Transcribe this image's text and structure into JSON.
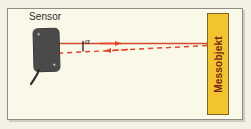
{
  "diagram": {
    "title_sensor": "Sensor",
    "title_target": "Messobjekt",
    "angle_symbol": "α",
    "icons": {
      "sensor_body": "sensor-block-icon",
      "mount_hole": "mounting-hole-icon",
      "cable": "cable-icon",
      "emitted_beam": "solid-arrow-right-icon",
      "reflected_beam": "dashed-arrow-left-icon",
      "angle_tick": "angle-tick-icon"
    },
    "colors": {
      "panel_background": "#faf8e8",
      "panel_border": "#8e8d84",
      "outer_background": "#f3f1e6",
      "sensor_fill": "#4a4a4a",
      "beam_red": "#e2452a",
      "target_fill": "#f2c430",
      "target_border": "#7d6a20",
      "target_text": "#7a2415",
      "label_text": "#2b2b2b"
    },
    "beams": [
      {
        "name": "emitted-beam",
        "style": "solid",
        "direction": "right",
        "from": "sensor",
        "to": "messobjekt"
      },
      {
        "name": "reflected-beam",
        "style": "dashed",
        "direction": "left",
        "from": "messobjekt",
        "to": "sensor"
      }
    ]
  }
}
